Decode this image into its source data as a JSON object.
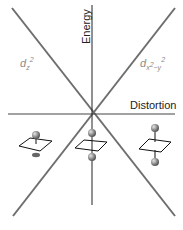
{
  "axes": {
    "y_label": "Energy",
    "x_label": "Distortion"
  },
  "orbitals": {
    "left": {
      "base": "d",
      "sub": "z",
      "sup": "2"
    },
    "right": {
      "base": "d",
      "sub": "x",
      "sup": "2",
      "sub2": "−y",
      "sup2": "2"
    }
  },
  "structures": [
    {
      "name": "elongated-left",
      "ligand_above": true,
      "ligand_below": "partial"
    },
    {
      "name": "square-planar-center",
      "ligand_above": true,
      "ligand_below": true
    },
    {
      "name": "compressed-right",
      "ligand_above": true,
      "ligand_below": true
    }
  ],
  "colors": {
    "line": "#6e6e6e",
    "axis": "#222222",
    "label_gray": "#8a8a8a",
    "sphere": "#8c8c8c"
  }
}
